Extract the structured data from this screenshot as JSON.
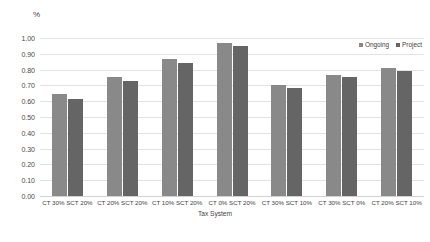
{
  "chart_data": {
    "type": "bar",
    "title": "",
    "subtitle": "",
    "xlabel": "Tax System",
    "ylabel": "%",
    "ylim": [
      0.0,
      1.0
    ],
    "ytick_labels": [
      "1.00",
      "0.90",
      "0.80",
      "0.70",
      "0.60",
      "0.50",
      "0.40",
      "0.30",
      "0.20",
      "0.10",
      "0.00"
    ],
    "ytick_values": [
      1.0,
      0.9,
      0.8,
      0.7,
      0.6,
      0.5,
      0.4,
      0.3,
      0.2,
      0.1,
      0.0
    ],
    "grid": true,
    "legend_position": "top-right",
    "categories": [
      "CT 30% SCT 20%",
      "CT 20% SCT 20%",
      "CT 10% SCT 20%",
      "CT 0% SCT 20%",
      "CT 30% SCT 10%",
      "CT 30% SCT 0%",
      "CT 20% SCT 10%"
    ],
    "series": [
      {
        "name": "Ongoing",
        "color": "#898989",
        "values": [
          0.645,
          0.755,
          0.865,
          0.97,
          0.7,
          0.765,
          0.81
        ]
      },
      {
        "name": "Project",
        "color": "#656565",
        "values": [
          0.615,
          0.725,
          0.84,
          0.95,
          0.685,
          0.755,
          0.79
        ]
      }
    ]
  }
}
